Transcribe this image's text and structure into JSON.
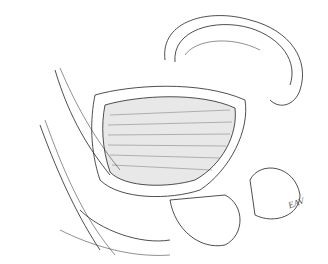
{
  "image": {
    "description": "Anatomical line drawing, sagittal view of pelvic organs",
    "signature": "EAV",
    "colors": {
      "background": "#ffffff",
      "ink": "#222222"
    }
  }
}
